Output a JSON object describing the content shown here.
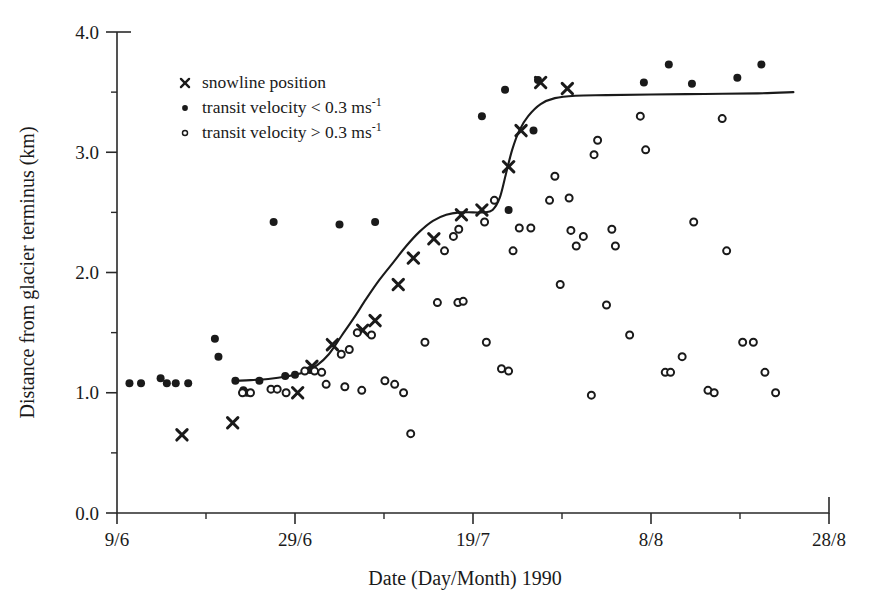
{
  "chart_data": {
    "type": "scatter",
    "title": "",
    "xlabel": "Date (Day/Month) 1990",
    "ylabel": "Distance from glacier terminus (km)",
    "xlim": [
      0,
      80
    ],
    "ylim": [
      0.0,
      4.0
    ],
    "grid": false,
    "x_tick_labels": [
      "9/6",
      "29/6",
      "19/7",
      "8/8",
      "28/8"
    ],
    "x_tick_values": [
      0,
      20,
      40,
      60,
      80
    ],
    "x_minor_tick_values": [
      10,
      30,
      50,
      70
    ],
    "y_tick_labels": [
      "0.0",
      "1.0",
      "2.0",
      "3.0",
      "4.0"
    ],
    "y_tick_values": [
      0.0,
      1.0,
      2.0,
      3.0,
      4.0
    ],
    "y_minor_tick_values": [
      0.5,
      1.5,
      2.5,
      3.5
    ],
    "legend": {
      "position": "upper-left-inside",
      "entries": [
        {
          "marker": "cross",
          "label": "snowline position"
        },
        {
          "marker": "filled-circle",
          "label": "transit velocity < 0.3 ms",
          "exponent": "-1"
        },
        {
          "marker": "open-circle",
          "label": "transit velocity > 0.3 ms",
          "exponent": "-1"
        }
      ]
    },
    "series": [
      {
        "name": "snowline position",
        "marker": "cross",
        "points": [
          [
            7.3,
            0.65
          ],
          [
            13.0,
            0.75
          ],
          [
            20.3,
            1.0
          ],
          [
            21.9,
            1.22
          ],
          [
            24.2,
            1.4
          ],
          [
            27.6,
            1.52
          ],
          [
            29.0,
            1.6
          ],
          [
            31.6,
            1.9
          ],
          [
            33.3,
            2.12
          ],
          [
            35.6,
            2.28
          ],
          [
            38.7,
            2.48
          ],
          [
            41.0,
            2.52
          ],
          [
            44.0,
            2.88
          ],
          [
            45.4,
            3.18
          ],
          [
            47.6,
            3.58
          ],
          [
            50.6,
            3.53
          ]
        ]
      },
      {
        "name": "transit velocity < 0.3 ms-1",
        "marker": "filled-circle",
        "points": [
          [
            1.4,
            1.08
          ],
          [
            2.7,
            1.08
          ],
          [
            4.9,
            1.12
          ],
          [
            5.6,
            1.08
          ],
          [
            6.6,
            1.08
          ],
          [
            8.0,
            1.08
          ],
          [
            11.0,
            1.45
          ],
          [
            11.4,
            1.3
          ],
          [
            13.3,
            1.1
          ],
          [
            14.2,
            1.02
          ],
          [
            14.6,
            1.0
          ],
          [
            16.0,
            1.1
          ],
          [
            18.9,
            1.14
          ],
          [
            20.0,
            1.15
          ],
          [
            21.7,
            1.19
          ],
          [
            17.6,
            2.42
          ],
          [
            25.0,
            2.4
          ],
          [
            29.0,
            2.42
          ],
          [
            41.0,
            3.3
          ],
          [
            44.0,
            2.52
          ],
          [
            43.6,
            3.52
          ],
          [
            46.8,
            3.18
          ],
          [
            47.3,
            3.6
          ],
          [
            62.0,
            3.73
          ],
          [
            59.2,
            3.58
          ],
          [
            64.6,
            3.57
          ],
          [
            69.7,
            3.62
          ],
          [
            72.4,
            3.73
          ]
        ]
      },
      {
        "name": "transit velocity > 0.3 ms-1",
        "marker": "open-circle",
        "points": [
          [
            14.1,
            1.0
          ],
          [
            15.0,
            1.0
          ],
          [
            23.5,
            1.07
          ],
          [
            25.6,
            1.05
          ],
          [
            27.5,
            1.02
          ],
          [
            30.1,
            1.1
          ],
          [
            31.2,
            1.07
          ],
          [
            22.2,
            1.18
          ],
          [
            23.0,
            1.17
          ],
          [
            21.1,
            1.18
          ],
          [
            17.3,
            1.03
          ],
          [
            18.0,
            1.03
          ],
          [
            19.0,
            1.0
          ],
          [
            27.0,
            1.5
          ],
          [
            28.6,
            1.48
          ],
          [
            25.2,
            1.32
          ],
          [
            26.1,
            1.36
          ],
          [
            32.2,
            1.0
          ],
          [
            33.0,
            0.66
          ],
          [
            36.0,
            1.75
          ],
          [
            38.3,
            1.75
          ],
          [
            38.9,
            1.76
          ],
          [
            34.6,
            1.42
          ],
          [
            41.5,
            1.42
          ],
          [
            36.8,
            2.18
          ],
          [
            37.8,
            2.3
          ],
          [
            38.4,
            2.36
          ],
          [
            44.5,
            2.18
          ],
          [
            45.2,
            2.37
          ],
          [
            46.5,
            2.37
          ],
          [
            48.6,
            2.6
          ],
          [
            49.2,
            2.8
          ],
          [
            50.8,
            2.62
          ],
          [
            51.0,
            2.35
          ],
          [
            51.6,
            2.22
          ],
          [
            52.4,
            2.3
          ],
          [
            53.6,
            2.98
          ],
          [
            54.0,
            3.1
          ],
          [
            55.6,
            2.36
          ],
          [
            56.0,
            2.22
          ],
          [
            57.6,
            1.48
          ],
          [
            53.3,
            0.98
          ],
          [
            58.8,
            3.3
          ],
          [
            59.4,
            3.02
          ],
          [
            61.6,
            1.17
          ],
          [
            62.2,
            1.17
          ],
          [
            63.5,
            1.3
          ],
          [
            64.8,
            2.42
          ],
          [
            66.4,
            1.02
          ],
          [
            67.1,
            1.0
          ],
          [
            68.0,
            3.28
          ],
          [
            68.5,
            2.18
          ],
          [
            70.3,
            1.42
          ],
          [
            71.5,
            1.42
          ],
          [
            72.8,
            1.17
          ],
          [
            74.0,
            1.0
          ],
          [
            55.0,
            1.73
          ],
          [
            49.8,
            1.9
          ],
          [
            43.2,
            1.2
          ],
          [
            44.0,
            1.18
          ],
          [
            42.4,
            2.6
          ],
          [
            41.3,
            2.42
          ]
        ]
      }
    ],
    "fit_curve": {
      "name": "fitted snowline retreat curve",
      "points": [
        [
          13.5,
          1.1
        ],
        [
          15.0,
          1.105
        ],
        [
          17.0,
          1.115
        ],
        [
          19.0,
          1.135
        ],
        [
          21.0,
          1.17
        ],
        [
          22.5,
          1.23
        ],
        [
          23.8,
          1.32
        ],
        [
          25.2,
          1.47
        ],
        [
          26.6,
          1.62
        ],
        [
          28.0,
          1.78
        ],
        [
          29.5,
          1.94
        ],
        [
          31.0,
          2.08
        ],
        [
          32.5,
          2.22
        ],
        [
          34.0,
          2.34
        ],
        [
          35.5,
          2.43
        ],
        [
          37.0,
          2.48
        ],
        [
          38.5,
          2.5
        ],
        [
          40.0,
          2.5
        ],
        [
          41.2,
          2.5
        ],
        [
          42.2,
          2.52
        ],
        [
          43.0,
          2.62
        ],
        [
          43.7,
          2.82
        ],
        [
          44.4,
          3.02
        ],
        [
          45.2,
          3.18
        ],
        [
          46.2,
          3.3
        ],
        [
          47.6,
          3.4
        ],
        [
          49.2,
          3.45
        ],
        [
          51.5,
          3.47
        ],
        [
          55.0,
          3.475
        ],
        [
          60.0,
          3.48
        ],
        [
          66.0,
          3.485
        ],
        [
          72.0,
          3.49
        ],
        [
          76.0,
          3.5
        ]
      ]
    }
  }
}
